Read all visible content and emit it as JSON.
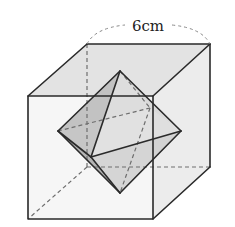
{
  "diagram": {
    "type": "cube-with-inscribed-octahedron",
    "dimension_label": "6cm",
    "colors": {
      "top_face": "#e3e3e3",
      "right_face": "#ececec",
      "front_face": "#f4f4f4",
      "back_face": "#ebebeb",
      "oct_dark": "#b8b8b8",
      "oct_mid": "#cfcfcf",
      "oct_light": "#dedede",
      "edge": "#2a2a2a",
      "hidden_edge": "#6e6e6e"
    },
    "cube": {
      "front_top_left": [
        28,
        96
      ],
      "front_top_right": [
        153,
        96
      ],
      "front_bottom_left": [
        28,
        219
      ],
      "front_bottom_right": [
        153,
        219
      ],
      "back_top_left": [
        87,
        44
      ],
      "back_top_right": [
        210,
        44
      ],
      "back_bottom_left": [
        87,
        167
      ],
      "back_bottom_right": [
        210,
        167
      ]
    },
    "octahedron": {
      "top": [
        120,
        71
      ],
      "bottom": [
        120,
        193
      ],
      "left": [
        58,
        131
      ],
      "right": [
        181,
        131
      ],
      "front": [
        91,
        157
      ],
      "back": [
        150,
        108
      ]
    }
  }
}
